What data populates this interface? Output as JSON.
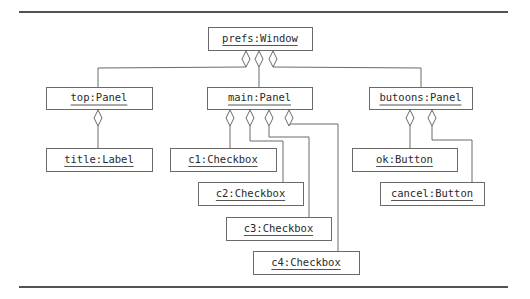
{
  "diagram": {
    "type": "uml-object-diagram",
    "objects": [
      {
        "id": "prefs",
        "label": "prefs:Window"
      },
      {
        "id": "top",
        "label": "top:Panel"
      },
      {
        "id": "main",
        "label": "main:Panel"
      },
      {
        "id": "butoons",
        "label": "butoons:Panel"
      },
      {
        "id": "title",
        "label": "title:Label"
      },
      {
        "id": "c1",
        "label": "c1:Checkbox"
      },
      {
        "id": "c2",
        "label": "c2:Checkbox"
      },
      {
        "id": "c3",
        "label": "c3:Checkbox"
      },
      {
        "id": "c4",
        "label": "c4:Checkbox"
      },
      {
        "id": "ok",
        "label": "ok:Button"
      },
      {
        "id": "cancel",
        "label": "cancel:Button"
      }
    ],
    "aggregations": [
      {
        "whole": "prefs",
        "part": "top"
      },
      {
        "whole": "prefs",
        "part": "main"
      },
      {
        "whole": "prefs",
        "part": "butoons"
      },
      {
        "whole": "top",
        "part": "title"
      },
      {
        "whole": "main",
        "part": "c1"
      },
      {
        "whole": "main",
        "part": "c2"
      },
      {
        "whole": "main",
        "part": "c3"
      },
      {
        "whole": "main",
        "part": "c4"
      },
      {
        "whole": "butoons",
        "part": "ok"
      },
      {
        "whole": "butoons",
        "part": "cancel"
      }
    ],
    "relationship_style": "hollow-diamond aggregation",
    "colors": {
      "line": "#6a6a6a",
      "text": "#2a2a2a",
      "rule": "#1a1a1a",
      "background": "#ffffff"
    }
  }
}
